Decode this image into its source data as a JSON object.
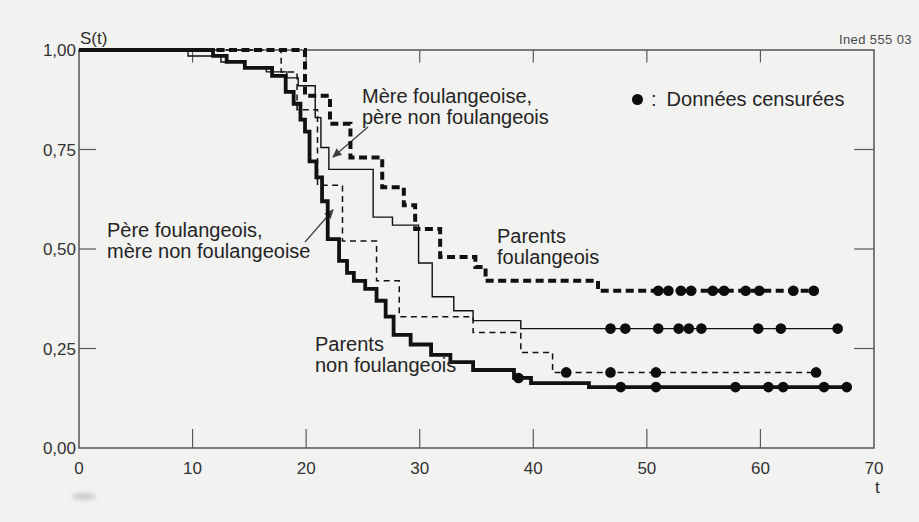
{
  "meta": {
    "source_note": "Ined 555 03"
  },
  "legend": {
    "marker": "censored-dot",
    "separator": ":",
    "label": "Données censurées"
  },
  "axes": {
    "y_title": "S(t)",
    "x_title": "t",
    "x_ticks": [
      "0",
      "10",
      "20",
      "30",
      "40",
      "50",
      "60",
      "70"
    ],
    "x_tick_values": [
      0,
      10,
      20,
      30,
      40,
      50,
      60,
      70
    ],
    "inner_x_ticks": [
      10,
      20,
      30,
      40,
      50,
      60
    ],
    "y_ticks": [
      "1,00",
      "0,75",
      "0,50",
      "0,25",
      "0,00"
    ],
    "y_tick_values": [
      1.0,
      0.75,
      0.5,
      0.25,
      0.0
    ],
    "inner_y_ticks": [
      0.25,
      0.5,
      0.75
    ],
    "x_range": [
      0,
      70
    ],
    "y_range": [
      0,
      1
    ],
    "grid": false
  },
  "annotations": [
    {
      "line1": "Mère foulangeoise,",
      "line2": "père non foulangeois",
      "x": 362,
      "y": 86,
      "arrow": {
        "x1": 368,
        "y1": 127,
        "x2": 333,
        "y2": 157
      }
    },
    {
      "line1": "Père foulangeois,",
      "line2": "mère non foulangeoise",
      "x": 107,
      "y": 220,
      "arrow": {
        "x1": 305,
        "y1": 242,
        "x2": 333,
        "y2": 210
      }
    },
    {
      "line1": "Parents",
      "line2": "foulangeois",
      "x": 497,
      "y": 226,
      "arrow": null
    },
    {
      "line1": "Parents",
      "line2": "non foulangeois",
      "x": 315,
      "y": 334,
      "arrow": null
    }
  ],
  "chart_data": {
    "type": "line",
    "subtype": "step-survival",
    "title": "",
    "xlabel": "t",
    "ylabel": "S(t)",
    "xlim": [
      0,
      70
    ],
    "ylim": [
      0,
      1
    ],
    "legend_note": "filled dots mark censored observations",
    "series": [
      {
        "name": "Mère foulangeoise, père non foulangeois",
        "style": "thin-solid",
        "end_t": 66.8,
        "points": [
          [
            0,
            1
          ],
          [
            9.6,
            0.985
          ],
          [
            12.5,
            0.97
          ],
          [
            14.5,
            0.957
          ],
          [
            16.5,
            0.945
          ],
          [
            18.3,
            0.93
          ],
          [
            19.3,
            0.91
          ],
          [
            20.8,
            0.83
          ],
          [
            21.3,
            0.755
          ],
          [
            22.0,
            0.7
          ],
          [
            25.9,
            0.58
          ],
          [
            27.6,
            0.56
          ],
          [
            29.9,
            0.465
          ],
          [
            31.1,
            0.38
          ],
          [
            33.0,
            0.345
          ],
          [
            34.7,
            0.32
          ],
          [
            38.9,
            0.3
          ]
        ],
        "censored": [
          [
            46.8,
            0.3
          ],
          [
            48.1,
            0.3
          ],
          [
            51.0,
            0.3
          ],
          [
            52.8,
            0.3
          ],
          [
            53.7,
            0.3
          ],
          [
            54.8,
            0.3
          ],
          [
            59.8,
            0.3
          ],
          [
            61.8,
            0.3
          ],
          [
            66.8,
            0.3
          ]
        ]
      },
      {
        "name": "Père foulangeois, mère non foulangeoise",
        "style": "thin-dashed",
        "end_t": 65.3,
        "points": [
          [
            0,
            1
          ],
          [
            17.8,
            0.945
          ],
          [
            19.2,
            0.85
          ],
          [
            21.0,
            0.66
          ],
          [
            23.2,
            0.52
          ],
          [
            26.2,
            0.42
          ],
          [
            28.2,
            0.33
          ],
          [
            34.7,
            0.29
          ],
          [
            38.9,
            0.24
          ],
          [
            41.7,
            0.19
          ]
        ],
        "censored": [
          [
            42.9,
            0.19
          ],
          [
            46.8,
            0.19
          ],
          [
            50.8,
            0.19
          ],
          [
            64.9,
            0.19
          ]
        ]
      },
      {
        "name": "Parents non foulangeois",
        "style": "thick-solid",
        "end_t": 68.0,
        "points": [
          [
            0,
            1
          ],
          [
            11.8,
            0.985
          ],
          [
            13.0,
            0.97
          ],
          [
            14.6,
            0.955
          ],
          [
            17.0,
            0.935
          ],
          [
            18.2,
            0.895
          ],
          [
            18.9,
            0.865
          ],
          [
            19.5,
            0.825
          ],
          [
            19.9,
            0.795
          ],
          [
            20.3,
            0.72
          ],
          [
            20.9,
            0.68
          ],
          [
            21.4,
            0.62
          ],
          [
            21.9,
            0.525
          ],
          [
            22.9,
            0.47
          ],
          [
            23.6,
            0.44
          ],
          [
            24.2,
            0.42
          ],
          [
            25.2,
            0.4
          ],
          [
            26.2,
            0.37
          ],
          [
            27.0,
            0.33
          ],
          [
            27.7,
            0.284
          ],
          [
            29.2,
            0.26
          ],
          [
            31.0,
            0.234
          ],
          [
            32.7,
            0.216
          ],
          [
            34.7,
            0.196
          ],
          [
            38.3,
            0.176
          ],
          [
            39.8,
            0.163
          ],
          [
            44.9,
            0.153
          ]
        ],
        "censored": [
          [
            38.7,
            0.176
          ],
          [
            47.7,
            0.153
          ],
          [
            50.8,
            0.153
          ],
          [
            57.8,
            0.153
          ],
          [
            60.7,
            0.153
          ],
          [
            62.0,
            0.153
          ],
          [
            65.6,
            0.153
          ],
          [
            67.6,
            0.153
          ]
        ]
      },
      {
        "name": "Parents foulangeois",
        "style": "thick-dashed",
        "end_t": 64.9,
        "points": [
          [
            0,
            1
          ],
          [
            19.9,
            0.885
          ],
          [
            22.1,
            0.815
          ],
          [
            23.9,
            0.73
          ],
          [
            26.7,
            0.655
          ],
          [
            28.6,
            0.61
          ],
          [
            29.6,
            0.55
          ],
          [
            31.8,
            0.48
          ],
          [
            34.9,
            0.455
          ],
          [
            35.8,
            0.42
          ],
          [
            45.7,
            0.395
          ]
        ],
        "censored": [
          [
            51.0,
            0.395
          ],
          [
            51.9,
            0.395
          ],
          [
            53.0,
            0.395
          ],
          [
            53.9,
            0.395
          ],
          [
            55.8,
            0.395
          ],
          [
            56.8,
            0.395
          ],
          [
            58.7,
            0.395
          ],
          [
            59.9,
            0.395
          ],
          [
            62.9,
            0.395
          ],
          [
            64.7,
            0.395
          ]
        ]
      }
    ]
  },
  "colors": {
    "curve": "#111111",
    "frame": "#4a4a4a",
    "tick": "#5a5a5a",
    "text": "#2b2b2b",
    "background": "#f2f2f0"
  }
}
